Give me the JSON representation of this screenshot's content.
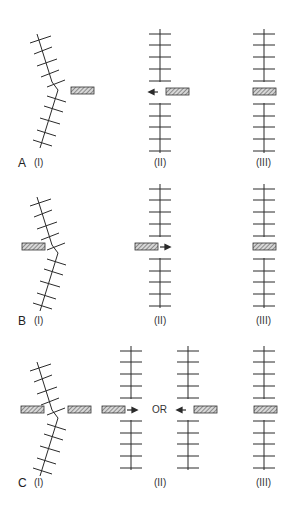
{
  "figure": {
    "rows": [
      {
        "letter": "A",
        "panels": [
          {
            "label": "(I)",
            "description": "bent chain with block to the right of kink"
          },
          {
            "label": "(II)",
            "description": "straightened chain with gap, block on right, arrow pointing left"
          },
          {
            "label": "(III)",
            "description": "block inserted into gap of straight chain"
          }
        ]
      },
      {
        "letter": "B",
        "panels": [
          {
            "label": "(I)",
            "description": "bent chain with block to the left of kink"
          },
          {
            "label": "(II)",
            "description": "straightened chain with gap, block on left, arrow pointing right"
          },
          {
            "label": "(III)",
            "description": "block inserted into gap of straight chain"
          }
        ]
      },
      {
        "letter": "C",
        "panels": [
          {
            "label": "(I)",
            "description": "bent chain with blocks on both sides of kink"
          },
          {
            "label": "(II)",
            "description": "two alternatives: block enters from left OR from right"
          },
          {
            "label": "(III)",
            "description": "block inserted into gap of straight chain"
          }
        ],
        "or_label": "OR"
      }
    ],
    "colors": {
      "line": "#2a2a2a",
      "block_fill": "#9a9a9a",
      "block_stroke": "#333333"
    }
  }
}
